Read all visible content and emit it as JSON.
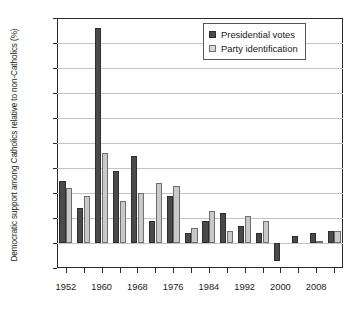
{
  "chart_data": {
    "type": "bar",
    "title": "",
    "xlabel": "",
    "ylabel": "Democratic support among Catholics relative to non-Catholics (%)",
    "ylim": [
      -5,
      45
    ],
    "ytick_step": 5,
    "yticks": [
      45,
      40,
      35,
      30,
      25,
      20,
      15,
      10,
      5,
      0,
      -5
    ],
    "ytick_labels": [
      "45",
      "40",
      "35",
      "30",
      "25",
      "20",
      "15",
      "10",
      "5",
      "0",
      "–5"
    ],
    "grid": true,
    "grid_axis": "y",
    "legend_position": "top-right",
    "categories": [
      1952,
      1956,
      1960,
      1964,
      1968,
      1972,
      1976,
      1980,
      1984,
      1988,
      1992,
      1996,
      2000,
      2004,
      2008,
      2012
    ],
    "xtick_labels": [
      "1952",
      "",
      "1960",
      "",
      "1968",
      "",
      "1976",
      "",
      "1984",
      "",
      "1992",
      "",
      "2000",
      "",
      "2008",
      ""
    ],
    "xtick_labels_shown": [
      "1952",
      "1960",
      "1968",
      "1976",
      "1984",
      "1992",
      "2000",
      "2008"
    ],
    "series": [
      {
        "name": "Presidential votes",
        "color": "#4a4a4a",
        "values": [
          12.5,
          7.0,
          43.0,
          14.5,
          17.5,
          4.5,
          9.5,
          2.0,
          4.5,
          6.0,
          3.5,
          2.0,
          -3.5,
          1.5,
          2.0,
          2.5
        ]
      },
      {
        "name": "Party identification",
        "color": "#c9c9c9",
        "values": [
          11.0,
          9.5,
          18.0,
          8.5,
          10.0,
          12.0,
          11.5,
          3.0,
          6.5,
          2.5,
          5.5,
          4.5,
          0.0,
          0.0,
          0.5,
          2.5
        ]
      }
    ]
  },
  "legend": {
    "items": [
      {
        "label": "Presidential votes",
        "style": "dark"
      },
      {
        "label": "Party identification",
        "style": "light"
      }
    ]
  },
  "colors": {
    "series_dark": "#4a4a4a",
    "series_light": "#c9c9c9",
    "axis": "#2b2b2b",
    "gridline": "#c4c4c4",
    "background": "#ffffff"
  }
}
